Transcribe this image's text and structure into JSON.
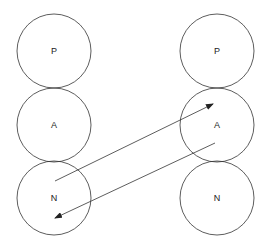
{
  "diagram": {
    "left_column": [
      {
        "label": "P",
        "cx": 54,
        "cy": 51
      },
      {
        "label": "A",
        "cx": 54,
        "cy": 125
      },
      {
        "label": "N",
        "cx": 54,
        "cy": 198
      }
    ],
    "right_column": [
      {
        "label": "P",
        "cx": 217,
        "cy": 51
      },
      {
        "label": "A",
        "cx": 217,
        "cy": 125
      },
      {
        "label": "N",
        "cx": 217,
        "cy": 198
      }
    ],
    "radius": 37,
    "arrows": [
      {
        "from": "left N",
        "to": "right A",
        "x1": 55,
        "y1": 181,
        "x2": 213,
        "y2": 104
      },
      {
        "from": "right A",
        "to": "left N",
        "x1": 215,
        "y1": 143,
        "x2": 55,
        "y2": 218
      }
    ],
    "stroke_color": "#333333"
  }
}
